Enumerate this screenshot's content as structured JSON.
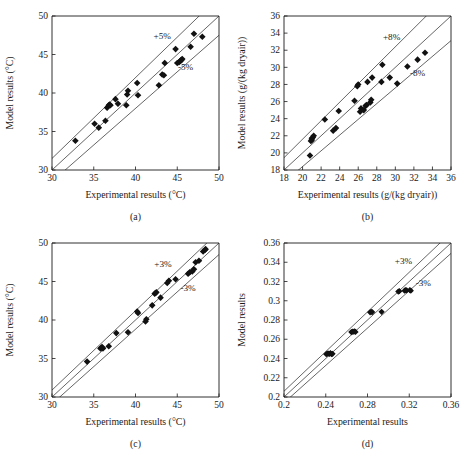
{
  "figure": {
    "title": "",
    "panel_order": [
      "a",
      "b",
      "c",
      "d"
    ]
  },
  "chart_data": [
    {
      "id": "a",
      "type": "scatter",
      "caption": "(a)",
      "title": "",
      "xlabel": "Experimental results (°C)",
      "ylabel": "Model results (°C)",
      "xlim": [
        30,
        50
      ],
      "ylim": [
        30,
        50
      ],
      "xticks": [
        30,
        35,
        40,
        45,
        50
      ],
      "yticks": [
        30,
        35,
        40,
        45,
        50
      ],
      "xticklabels": [
        "30",
        "35",
        "40",
        "45",
        "50"
      ],
      "yticklabels": [
        "30",
        "35",
        "40",
        "45",
        "50"
      ],
      "grid": false,
      "legend": "none",
      "parity_line": true,
      "error_bands": [
        {
          "label": "+5%",
          "percent": 5
        },
        {
          "label": "-5%",
          "percent": -5
        }
      ],
      "band_label_positions": [
        {
          "label": "+5%",
          "x": 43.2,
          "y": 47.4
        },
        {
          "label": "-5%",
          "x": 46.0,
          "y": 43.4
        }
      ],
      "x": [
        32.8,
        35.1,
        35.6,
        36.4,
        36.6,
        36.8,
        36.9,
        37.0,
        37.6,
        37.9,
        38.9,
        39.0,
        39.1,
        40.2,
        40.3,
        42.8,
        43.2,
        43.4,
        43.5,
        44.8,
        45.0,
        45.2,
        45.3,
        45.4,
        45.5,
        45.6,
        46.6,
        47.0,
        48.0
      ],
      "y": [
        33.8,
        36.0,
        35.5,
        36.4,
        38.1,
        38.4,
        38.5,
        38.4,
        39.2,
        38.6,
        38.4,
        39.8,
        40.3,
        41.3,
        39.7,
        41.0,
        42.4,
        42.3,
        43.9,
        45.7,
        43.9,
        44.0,
        44.1,
        44.2,
        44.3,
        44.4,
        46.0,
        47.7,
        47.3
      ]
    },
    {
      "id": "b",
      "type": "scatter",
      "caption": "(b)",
      "title": "",
      "xlabel": "Experimental results (g/(kg dryair))",
      "ylabel": "Model results (g/(kg dryair))",
      "xlim": [
        18,
        36
      ],
      "ylim": [
        18,
        36
      ],
      "xticks": [
        18,
        20,
        22,
        24,
        26,
        28,
        30,
        32,
        34,
        36
      ],
      "yticks": [
        18,
        20,
        22,
        24,
        26,
        28,
        30,
        32,
        34,
        36
      ],
      "xticklabels": [
        "18",
        "20",
        "22",
        "24",
        "26",
        "28",
        "30",
        "32",
        "34",
        "36"
      ],
      "yticklabels": [
        "18",
        "20",
        "22",
        "24",
        "26",
        "28",
        "30",
        "32",
        "34",
        "36"
      ],
      "grid": false,
      "legend": "none",
      "parity_line": true,
      "error_bands": [
        {
          "label": "+8%",
          "percent": 8
        },
        {
          "label": "-8%",
          "percent": -8
        }
      ],
      "band_label_positions": [
        {
          "label": "+8%",
          "x": 29.6,
          "y": 33.6
        },
        {
          "label": "-8%",
          "x": 32.4,
          "y": 29.3
        }
      ],
      "x": [
        20.8,
        20.9,
        21.0,
        21.0,
        21.1,
        21.2,
        22.4,
        23.3,
        23.6,
        23.9,
        25.6,
        25.9,
        26.0,
        26.2,
        26.3,
        26.6,
        26.8,
        26.9,
        27.0,
        27.3,
        27.4,
        27.5,
        28.5,
        28.6,
        29.4,
        30.2,
        31.3,
        32.4,
        33.2
      ],
      "y": [
        19.7,
        21.4,
        21.5,
        21.7,
        21.8,
        22.0,
        23.9,
        22.6,
        22.9,
        24.9,
        26.1,
        27.8,
        28.0,
        24.8,
        25.2,
        25.0,
        25.5,
        25.6,
        28.3,
        25.9,
        26.2,
        28.8,
        28.3,
        30.3,
        28.8,
        28.1,
        30.1,
        30.9,
        31.7
      ]
    },
    {
      "id": "c",
      "type": "scatter",
      "caption": "(c)",
      "title": "",
      "xlabel": "Experimental results (°C)",
      "ylabel": "Model results (°C)",
      "xlim": [
        30,
        50
      ],
      "ylim": [
        30,
        50
      ],
      "xticks": [
        30,
        35,
        40,
        45,
        50
      ],
      "yticks": [
        30,
        35,
        40,
        45,
        50
      ],
      "xticklabels": [
        "30",
        "35",
        "40",
        "45",
        "50"
      ],
      "yticklabels": [
        "30",
        "35",
        "40",
        "45",
        "50"
      ],
      "grid": false,
      "legend": "none",
      "parity_line": true,
      "error_bands": [
        {
          "label": "+3%",
          "percent": 3
        },
        {
          "label": "-3%",
          "percent": -3
        }
      ],
      "band_label_positions": [
        {
          "label": "+3%",
          "x": 43.3,
          "y": 47.3
        },
        {
          "label": "-3%",
          "x": 46.3,
          "y": 44.1
        }
      ],
      "x": [
        34.2,
        35.8,
        35.9,
        36.0,
        36.1,
        36.8,
        37.7,
        39.1,
        40.2,
        40.3,
        41.2,
        41.3,
        42.0,
        42.3,
        42.4,
        42.5,
        43.0,
        43.8,
        44.0,
        44.8,
        46.3,
        46.5,
        46.8,
        47.0,
        47.2,
        47.6,
        48.1,
        48.3,
        48.4
      ],
      "y": [
        34.6,
        36.3,
        36.4,
        36.5,
        36.3,
        36.6,
        38.3,
        38.4,
        41.1,
        40.9,
        39.8,
        40.1,
        41.9,
        43.4,
        43.5,
        43.6,
        42.9,
        44.8,
        45.1,
        45.3,
        46.0,
        46.2,
        46.3,
        46.6,
        47.5,
        47.7,
        48.9,
        49.1,
        49.2
      ]
    },
    {
      "id": "d",
      "type": "scatter",
      "caption": "(d)",
      "title": "",
      "xlabel": "Experimental results",
      "ylabel": "Model results",
      "xlim": [
        0.2,
        0.36
      ],
      "ylim": [
        0.2,
        0.36
      ],
      "xticks": [
        0.2,
        0.24,
        0.28,
        0.32,
        0.36
      ],
      "yticks": [
        0.2,
        0.22,
        0.24,
        0.26,
        0.28,
        0.3,
        0.32,
        0.34,
        0.36
      ],
      "xticklabels": [
        "0.2",
        "0.24",
        "0.28",
        "0.32",
        "0.36"
      ],
      "yticklabels": [
        "0.2",
        "0.22",
        "0.24",
        "0.26",
        "0.28",
        "0.3",
        "0.32",
        "0.34",
        "0.36"
      ],
      "grid": false,
      "legend": "none",
      "parity_line": true,
      "error_bands": [
        {
          "label": "+3%",
          "percent": 3
        },
        {
          "label": "-3%",
          "percent": -3
        }
      ],
      "band_label_positions": [
        {
          "label": "+3%",
          "x": 0.3145,
          "y": 0.3415
        },
        {
          "label": "-3%",
          "x": 0.3335,
          "y": 0.3185
        }
      ],
      "x": [
        0.2405,
        0.2415,
        0.2425,
        0.2435,
        0.2445,
        0.2455,
        0.2465,
        0.2645,
        0.2655,
        0.2665,
        0.2675,
        0.2685,
        0.2825,
        0.2835,
        0.2845,
        0.2935,
        0.3095,
        0.3105,
        0.3155,
        0.3165,
        0.3175,
        0.3205,
        0.3215
      ],
      "y": [
        0.2445,
        0.245,
        0.2452,
        0.2448,
        0.2455,
        0.2446,
        0.2449,
        0.2675,
        0.268,
        0.2678,
        0.2682,
        0.2676,
        0.288,
        0.2885,
        0.2882,
        0.2885,
        0.3095,
        0.31,
        0.3105,
        0.311,
        0.3108,
        0.311,
        0.3105
      ]
    }
  ]
}
